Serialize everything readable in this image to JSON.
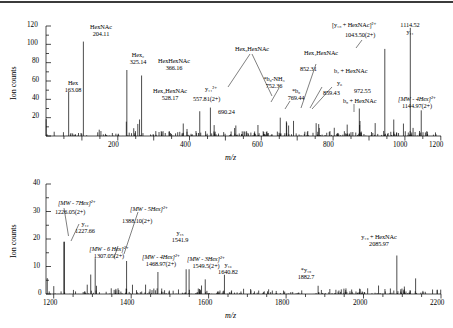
{
  "figure": {
    "type": "mass-spectrum",
    "panel_count": 2,
    "axis_title_mz": "m/z",
    "axis_title_counts": "Ion counts"
  },
  "chart_data": [
    {
      "id": "top-panel",
      "type": "line",
      "title": "",
      "xlabel": "m/z",
      "ylabel": "Ion counts",
      "xlim": [
        100,
        1200
      ],
      "ylim": [
        0,
        120
      ],
      "xticks": [
        200,
        400,
        600,
        800,
        1000,
        1200
      ],
      "yticks": [
        0,
        20,
        40,
        60,
        80,
        100,
        120
      ],
      "xtick_labels": [
        "200",
        "400",
        "600",
        "800",
        "1000",
        "1200"
      ],
      "ytick_labels": [
        "0",
        "20",
        "40",
        "60",
        "80",
        "100",
        "120"
      ],
      "grid": false,
      "legend": "none",
      "labeled_peaks": [
        {
          "mz": 163.08,
          "intensity": 48,
          "name": "Hex",
          "value_label": "163.08"
        },
        {
          "mz": 204.11,
          "intensity": 103,
          "name": "HexNAc",
          "value_label": "204.11"
        },
        {
          "mz": 325.14,
          "intensity": 72,
          "name": "Hex2",
          "value_label": "325.14"
        },
        {
          "mz": 366.16,
          "intensity": 66,
          "name": "HexHexNAc",
          "value_label": "366.16"
        },
        {
          "mz": 528.17,
          "intensity": 27,
          "name": "Hex3HexNAc",
          "value_label": "528.17"
        },
        {
          "mz": 557.81,
          "intensity": 31,
          "name": "y11(2+)",
          "value_label": "557.81(2+)"
        },
        {
          "mz": 690.24,
          "intensity": 12,
          "name": "Hex5HexNAc",
          "value_label": "690.24"
        },
        {
          "mz": 752.36,
          "intensity": 20,
          "name": "*b9-NH3",
          "value_label": "752.36"
        },
        {
          "mz": 769.44,
          "intensity": 16,
          "name": "*b9",
          "value_label": "769.44"
        },
        {
          "mz": 852.31,
          "intensity": 14,
          "name": "Hex4HexNAc",
          "value_label": "852.31"
        },
        {
          "mz": 859.43,
          "intensity": 13,
          "name": "y6",
          "value_label": "859.43"
        },
        {
          "mz": 972.55,
          "intensity": 30,
          "name": "b8 + HexNAc",
          "value_label": "972.55"
        },
        {
          "mz": 1043.5,
          "intensity": 95,
          "name": "[y10 + HexNAc]2+",
          "value_label": "1043.50(2+)"
        },
        {
          "mz": 1114.52,
          "intensity": 118,
          "name": "y11",
          "value_label": "1114.52"
        },
        {
          "mz": 1144.97,
          "intensity": 28,
          "name": "[MW - 4Hex]2+",
          "value_label": "1144.97(2+)"
        }
      ],
      "annotations": [
        {
          "key": "hex",
          "text": "Hex",
          "value": "163.08"
        },
        {
          "key": "hexnac",
          "text": "HexNAc",
          "value": "204.11"
        },
        {
          "key": "hex2",
          "text": "Hex₂",
          "value": "325.14"
        },
        {
          "key": "hexhexnac",
          "text": "HexHexNAc",
          "value": "366.16"
        },
        {
          "key": "hex3hexnac",
          "text": "Hex₃HexNAc",
          "value": "528.17"
        },
        {
          "key": "y11_2plus",
          "text": "y₁₁²⁺",
          "value": "557.81(2+)"
        },
        {
          "key": "hex5hexnac",
          "text": "Hex₅HexNAc",
          "value": "690.24"
        },
        {
          "key": "b9nh3",
          "text": "*b₉-NH₃",
          "value": "752.36"
        },
        {
          "key": "b9",
          "text": "*b₉",
          "value": "769.44"
        },
        {
          "key": "hex4hexnac",
          "text": "Hex₄HexNAc",
          "value": "852.31"
        },
        {
          "key": "b7hexnac",
          "text": "b₇ + HexNAc",
          "value": ""
        },
        {
          "key": "y6",
          "text": "y₆",
          "value": "859.43"
        },
        {
          "key": "b8hexnac",
          "text": "b₈ + HexNAc",
          "value": "972.55"
        },
        {
          "key": "y10hexnac",
          "text": "[y₁₀ + HexNAc]²⁺",
          "value": "1043.50(2+)"
        },
        {
          "key": "y11",
          "text": "y₁₁",
          "value": "1114.52"
        },
        {
          "key": "mw4hex",
          "text": "[MW - 4Hex]²⁺",
          "value": "1144.97(2+)"
        }
      ]
    },
    {
      "id": "bottom-panel",
      "type": "line",
      "title": "",
      "xlabel": "m/z",
      "ylabel": "Ion counts",
      "xlim": [
        1180,
        2200
      ],
      "ylim": [
        0,
        40
      ],
      "xticks": [
        1200,
        1400,
        1600,
        1800,
        2000,
        2200
      ],
      "yticks": [
        0,
        10,
        20,
        30,
        40
      ],
      "xtick_labels": [
        "1200",
        "1400",
        "1600",
        "1800",
        "2000",
        "2200"
      ],
      "ytick_labels": [
        "0",
        "10",
        "20",
        "30",
        "40"
      ],
      "grid": false,
      "legend": "none",
      "labeled_peaks": [
        {
          "mz": 1226.05,
          "intensity": 19,
          "name": "[MW - 7Hex]2+",
          "value_label": "1226.05(2+)"
        },
        {
          "mz": 1227.66,
          "intensity": 19,
          "name": "y12",
          "value_label": "1227.66"
        },
        {
          "mz": 1307.05,
          "intensity": 13,
          "name": "[MW - 6 Hex]2+",
          "value_label": "1307.05(2+)"
        },
        {
          "mz": 1388.1,
          "intensity": 12,
          "name": "[MW - 5Hex]2+",
          "value_label": "1388.10(2+)"
        },
        {
          "mz": 1468.97,
          "intensity": 8,
          "name": "[MW - 4Hex]2+",
          "value_label": "1468.97(2+)"
        },
        {
          "mz": 1541.9,
          "intensity": 9,
          "name": "y15",
          "value_label": "1541.9"
        },
        {
          "mz": 1549.5,
          "intensity": 9,
          "name": "[MW - 3Hex]2+",
          "value_label": "1549.5(2+)"
        },
        {
          "mz": 1640.82,
          "intensity": 7,
          "name": "y16",
          "value_label": "1640.82"
        },
        {
          "mz": 1882.7,
          "intensity": 3,
          "name": "*y19",
          "value_label": "1882.7"
        },
        {
          "mz": 2085.97,
          "intensity": 14,
          "name": "y19 + HexNAc",
          "value_label": "2085.97"
        }
      ],
      "annotations": [
        {
          "key": "mw7hex",
          "text": "[MW - 7Hex]²⁺",
          "value": "1226.05(2+)"
        },
        {
          "key": "y12",
          "text": "y₁₂",
          "value": "1227.66"
        },
        {
          "key": "mw6hex",
          "text": "[MW - 6 Hex]²⁺",
          "value": "1307.05(2+)"
        },
        {
          "key": "mw5hex",
          "text": "[MW - 5Hex]²⁺",
          "value": "1388.10(2+)"
        },
        {
          "key": "mw4hex",
          "text": "[MW - 4Hex]²⁺",
          "value": "1468.97(2+)"
        },
        {
          "key": "y15",
          "text": "y₁₅",
          "value": "1541.9"
        },
        {
          "key": "mw3hex",
          "text": "[MW - 3Hex]²⁺",
          "value": "1549.5(2+)"
        },
        {
          "key": "y16",
          "text": "y₁₆",
          "value": "1640.82"
        },
        {
          "key": "y19star",
          "text": "*y₁₉",
          "value": "1882.7"
        },
        {
          "key": "y19hexnac",
          "text": "y₁₉ + HexNAc",
          "value": "2085.97"
        }
      ]
    }
  ]
}
